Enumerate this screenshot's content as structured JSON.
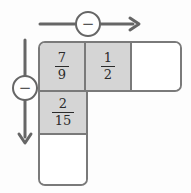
{
  "diagram": {
    "horizontal_operator": {
      "symbol": "−",
      "operation": "subtraction",
      "direction": "right"
    },
    "vertical_operator": {
      "symbol": "−",
      "operation": "subtraction",
      "direction": "down"
    },
    "top_row": [
      {
        "numerator": "7",
        "denominator": "9",
        "shaded": true
      },
      {
        "numerator": "1",
        "denominator": "2",
        "shaded": true
      },
      {
        "value": "",
        "shaded": false,
        "role": "answer-cell"
      }
    ],
    "left_column": [
      {
        "numerator": "7",
        "denominator": "9",
        "shaded": true
      },
      {
        "numerator": "2",
        "denominator": "15",
        "shaded": true
      },
      {
        "value": "",
        "shaded": false,
        "role": "answer-cell"
      }
    ],
    "colors": {
      "cell_fill": "#d5d5d5",
      "cell_border": "#7a7a7a",
      "arrow": "#666666",
      "text": "#2b2b2b",
      "background": "#fdfdfd"
    }
  }
}
